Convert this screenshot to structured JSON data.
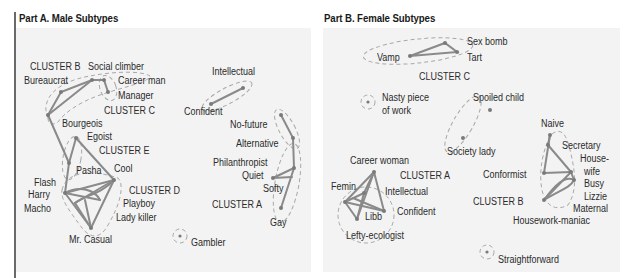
{
  "partA": {
    "title": "Part A. Male Subtypes",
    "clusters": [
      "CLUSTER A",
      "CLUSTER B",
      "CLUSTER C",
      "CLUSTER D",
      "CLUSTER E"
    ],
    "labels": {
      "social_climber": "Social climber",
      "bureaucrat": "Bureaucrat",
      "career_man": "Career man",
      "manager": "Manager",
      "bourgeois": "Bourgeois",
      "egoist": "Egoist",
      "pasha": "Pasha",
      "cool": "Cool",
      "flash": "Flash",
      "harry": "Harry",
      "macho": "Macho",
      "playboy": "Playboy",
      "lady_killer": "Lady killer",
      "mr_casual": "Mr. Casual",
      "intellectual": "Intellectual",
      "confident": "Confident",
      "no_future": "No-future",
      "alternative": "Alternative",
      "philanthropist": "Philanthropist",
      "quiet": "Quiet",
      "softy": "Softy",
      "gay": "Gay",
      "gambler": "Gambler"
    }
  },
  "partB": {
    "title": "Part B. Female Subtypes",
    "clusters": [
      "CLUSTER A",
      "CLUSTER B",
      "CLUSTER C"
    ],
    "labels": {
      "sex_bomb": "Sex bomb",
      "vamp": "Vamp",
      "tart": "Tart",
      "nasty1": "Nasty piece",
      "nasty2": "of work",
      "spoiled_child": "Spoiled child",
      "society_lady": "Society lady",
      "naive": "Naive",
      "secretary": "Secretary",
      "house1": "House-",
      "house2": "wife",
      "busy": "Busy",
      "lizzie": "Lizzie",
      "maternal": "Maternal",
      "housework_maniac": "Housework-maniac",
      "conformist": "Conformist",
      "career_woman": "Career woman",
      "femin": "Femin",
      "intellectual": "Intellectual",
      "confident": "Confident",
      "libb": "Libb",
      "lefty_ecologist": "Lefty-ecologist",
      "straightforward": "Straightforward"
    }
  },
  "colors": {
    "panel_bg": "#f3f3f3",
    "edge": "#8a8a8a",
    "node": "#7a7a7a",
    "dash": "#a8a8a8",
    "text": "#2b2b2b"
  }
}
